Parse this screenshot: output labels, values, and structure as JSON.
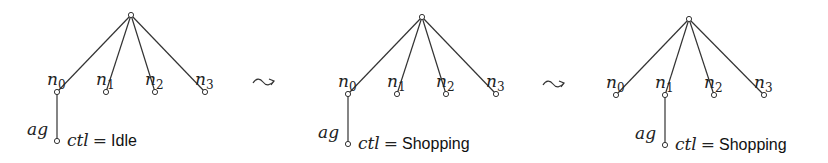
{
  "figure": {
    "transition_symbol": "leads-to",
    "panels": [
      {
        "root": {
          "x": 131,
          "y": 15
        },
        "leaves": [
          {
            "label": "n",
            "sub": "0",
            "x": 57,
            "y": 92
          },
          {
            "label": "n",
            "sub": "1",
            "x": 106,
            "y": 92
          },
          {
            "label": "n",
            "sub": "2",
            "x": 155,
            "y": 92
          },
          {
            "label": "n",
            "sub": "3",
            "x": 205,
            "y": 92
          }
        ],
        "agent": {
          "label": "ag",
          "attached_to": 0,
          "x": 57,
          "y": 141,
          "ctl_name": "ctl",
          "ctl_eq": "=",
          "ctl_value": "Idle"
        }
      },
      {
        "root": {
          "x": 422,
          "y": 17
        },
        "leaves": [
          {
            "label": "n",
            "sub": "0",
            "x": 348,
            "y": 94
          },
          {
            "label": "n",
            "sub": "1",
            "x": 397,
            "y": 94
          },
          {
            "label": "n",
            "sub": "2",
            "x": 446,
            "y": 94
          },
          {
            "label": "n",
            "sub": "3",
            "x": 496,
            "y": 94
          }
        ],
        "agent": {
          "label": "ag",
          "attached_to": 0,
          "x": 348,
          "y": 144,
          "ctl_name": "ctl",
          "ctl_eq": "=",
          "ctl_value": "Shopping"
        }
      },
      {
        "root": {
          "x": 689,
          "y": 19
        },
        "leaves": [
          {
            "label": "n",
            "sub": "0",
            "x": 616,
            "y": 95
          },
          {
            "label": "n",
            "sub": "1",
            "x": 665,
            "y": 95
          },
          {
            "label": "n",
            "sub": "2",
            "x": 714,
            "y": 95
          },
          {
            "label": "n",
            "sub": "3",
            "x": 764,
            "y": 95
          }
        ],
        "agent": {
          "label": "ag",
          "attached_to": 1,
          "x": 665,
          "y": 145,
          "ctl_name": "ctl",
          "ctl_eq": "=",
          "ctl_value": "Shopping"
        }
      }
    ],
    "arrows": [
      {
        "x": 253,
        "y": 82
      },
      {
        "x": 543,
        "y": 84
      }
    ]
  }
}
